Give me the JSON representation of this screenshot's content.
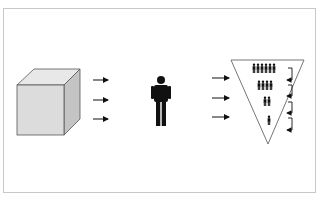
{
  "diagram": {
    "type": "process-flow",
    "nodes": [
      {
        "id": "cube",
        "shape": "3d-cube",
        "label": ""
      },
      {
        "id": "person",
        "shape": "person-icon",
        "label": ""
      },
      {
        "id": "funnel",
        "shape": "inverted-triangle",
        "label": "",
        "rows": [
          {
            "people": 6
          },
          {
            "people": 4
          },
          {
            "people": 2
          },
          {
            "people": 1
          }
        ]
      }
    ],
    "edges": [
      {
        "from": "cube",
        "to": "person",
        "arrows": 3
      },
      {
        "from": "person",
        "to": "funnel",
        "arrows": 3
      }
    ],
    "feedback_arrows": 4,
    "colors": {
      "cube_front": "#dcdcdc",
      "cube_top": "#e8e8e8",
      "cube_side": "#c4c4c4",
      "ink": "#111111",
      "frame": "#c8c8c8"
    }
  }
}
